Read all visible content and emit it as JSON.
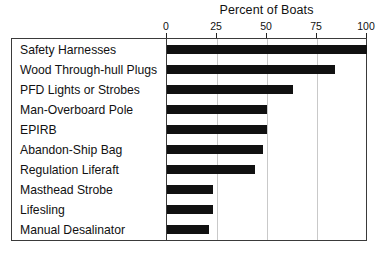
{
  "chart_data": {
    "type": "bar",
    "orientation": "horizontal",
    "title": "Percent of Boats",
    "xlabel": "",
    "ylabel": "",
    "xlim": [
      0,
      100
    ],
    "xticks": [
      0,
      25,
      50,
      75,
      100
    ],
    "xtick_labels": [
      "0",
      "25",
      "50",
      "75",
      "100"
    ],
    "grid": true,
    "grid_axis": "x",
    "legend": false,
    "axis_position": "top",
    "bar_color": "#111111",
    "categories": [
      "Safety Harnesses",
      "Wood Through-hull Plugs",
      "PFD Lights or Strobes",
      "Man-Overboard Pole",
      "EPIRB",
      "Abandon-Ship Bag",
      "Regulation Liferaft",
      "Masthead Strobe",
      "Lifesling",
      "Manual Desalinator"
    ],
    "values": [
      100,
      84,
      63,
      50,
      50,
      48,
      44,
      23,
      23,
      21
    ]
  },
  "colors": {
    "bar": "#111111",
    "frame": "#3a3a3a",
    "grid": "#c9c9c9",
    "text": "#111111",
    "background": "#ffffff"
  }
}
